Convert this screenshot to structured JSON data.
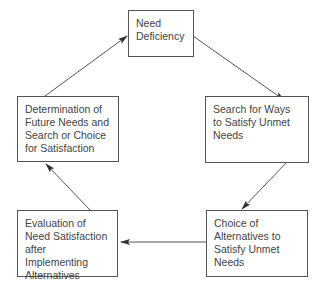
{
  "diagram": {
    "type": "cycle-flowchart",
    "colors": {
      "line": "#555555",
      "text": "#444444",
      "background": "#ffffff"
    },
    "nodes": [
      {
        "id": "need",
        "label": "Need\nDeficiency"
      },
      {
        "id": "search",
        "label": "Search for Ways\nto Satisfy Unmet\nNeeds"
      },
      {
        "id": "choice",
        "label": "Choice of\nAlternatives to\nSatisfy Unmet\nNeeds"
      },
      {
        "id": "evaluation",
        "label": "Evaluation of\nNeed Satisfaction\nafter Implementing\nAlternatives"
      },
      {
        "id": "determination",
        "label": "Determination of\nFuture Needs and\nSearch or Choice\nfor Satisfaction"
      }
    ],
    "edges": [
      {
        "from": "need",
        "to": "search"
      },
      {
        "from": "search",
        "to": "choice"
      },
      {
        "from": "choice",
        "to": "evaluation"
      },
      {
        "from": "evaluation",
        "to": "determination"
      },
      {
        "from": "determination",
        "to": "need"
      }
    ]
  }
}
